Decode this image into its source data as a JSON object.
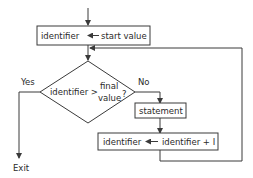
{
  "diagram": {
    "type": "flowchart",
    "nodes": {
      "init": {
        "left": "identifier",
        "arrow": "assign-left-arrow",
        "right": "start value"
      },
      "decision": {
        "line1_left": "identifier >",
        "line1_right": "final",
        "line2": "value",
        "question": "?"
      },
      "statement": {
        "label": "statement"
      },
      "increment": {
        "left": "identifier",
        "arrow": "assign-left-arrow",
        "right": "identifier + I"
      }
    },
    "edges": {
      "yes": "Yes",
      "no": "No",
      "exit": "Exit"
    },
    "colors": {
      "stroke": "#3a3a3a",
      "text": "#2a2a2a",
      "background": "#ffffff"
    }
  }
}
